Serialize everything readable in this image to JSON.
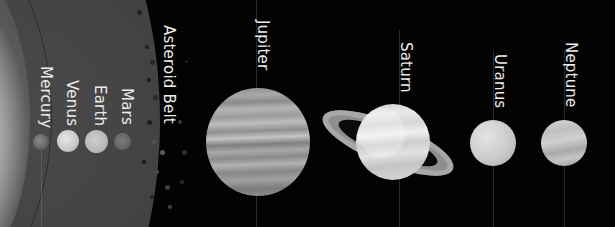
{
  "image": {
    "description": "Grayscale illustration of the solar system with the Sun glow at left and planets labeled in rotated text",
    "labels": {
      "mercury": "Mercury",
      "venus": "Venus",
      "earth": "Earth",
      "mars": "Mars",
      "asteroid_belt": "Asteroid Belt",
      "jupiter": "Jupiter",
      "saturn": "Saturn",
      "uranus": "Uranus",
      "neptune": "Neptune"
    },
    "colors": {
      "background": "#030303",
      "inner_region": "#404040",
      "label_text": "#ececec",
      "sun": "#ffffff"
    }
  }
}
